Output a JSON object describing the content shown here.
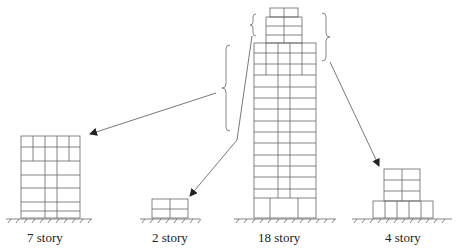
{
  "diagram": {
    "buildings": [
      {
        "id": "7-story",
        "label": "7 story",
        "stories": 7
      },
      {
        "id": "2-story",
        "label": "2 story",
        "stories": 2
      },
      {
        "id": "18-story",
        "label": "18 story",
        "stories": 18
      },
      {
        "id": "4-story",
        "label": "4 story",
        "stories": 4
      }
    ],
    "arrows": [
      {
        "from": "18-story left brace (middle floors)",
        "to": "7-story"
      },
      {
        "from": "18-story top-left brace (upper floors)",
        "to": "2-story"
      },
      {
        "from": "18-story right brace (top floors)",
        "to": "4-story"
      }
    ],
    "colors": {
      "line": "#555555",
      "brace": "#888888",
      "text": "#222222"
    }
  }
}
